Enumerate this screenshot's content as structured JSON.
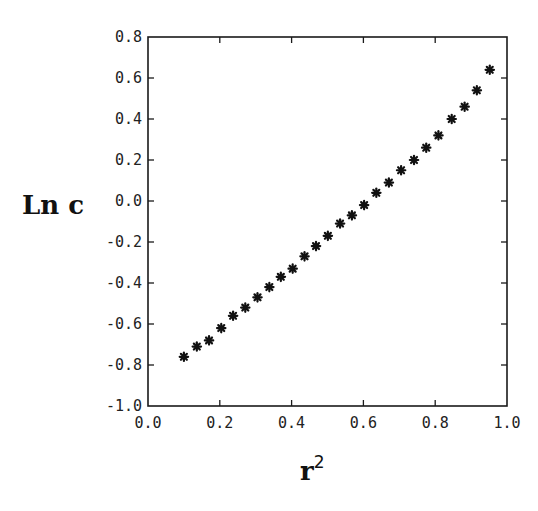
{
  "chart_data": {
    "type": "scatter",
    "title": "",
    "xlabel": "r",
    "xlabel_superscript": "2",
    "ylabel": "Ln c",
    "xlim": [
      0.0,
      1.0
    ],
    "ylim": [
      -1.0,
      0.8
    ],
    "grid": false,
    "legend": null,
    "marker": "asterisk",
    "x_ticks": [
      "0.0",
      "0.2",
      "0.4",
      "0.6",
      "0.8",
      "1.0"
    ],
    "x_tick_values": [
      0.0,
      0.2,
      0.4,
      0.6,
      0.8,
      1.0
    ],
    "y_ticks": [
      "-1.0",
      "-0.8",
      "-0.6",
      "-0.4",
      "-0.2",
      "0.0",
      "0.2",
      "0.4",
      "0.6",
      "0.8"
    ],
    "y_tick_values": [
      -1.0,
      -0.8,
      -0.6,
      -0.4,
      -0.2,
      0.0,
      0.2,
      0.4,
      0.6,
      0.8
    ],
    "series": [
      {
        "name": "Ln c vs r^2",
        "x": [
          0.1,
          0.136,
          0.17,
          0.204,
          0.237,
          0.271,
          0.305,
          0.338,
          0.37,
          0.403,
          0.436,
          0.468,
          0.501,
          0.535,
          0.568,
          0.602,
          0.636,
          0.671,
          0.705,
          0.741,
          0.775,
          0.809,
          0.846,
          0.882,
          0.916,
          0.952
        ],
        "y": [
          -0.76,
          -0.71,
          -0.68,
          -0.62,
          -0.56,
          -0.52,
          -0.47,
          -0.42,
          -0.37,
          -0.33,
          -0.27,
          -0.22,
          -0.17,
          -0.11,
          -0.07,
          -0.02,
          0.04,
          0.09,
          0.15,
          0.2,
          0.26,
          0.32,
          0.4,
          0.46,
          0.54,
          0.64
        ]
      }
    ]
  },
  "plot_area": {
    "left": 148,
    "top": 37,
    "right": 507,
    "bottom": 406
  },
  "colors": {
    "axis": "#1a1a1a",
    "marker": "#111111",
    "background": "#ffffff"
  }
}
